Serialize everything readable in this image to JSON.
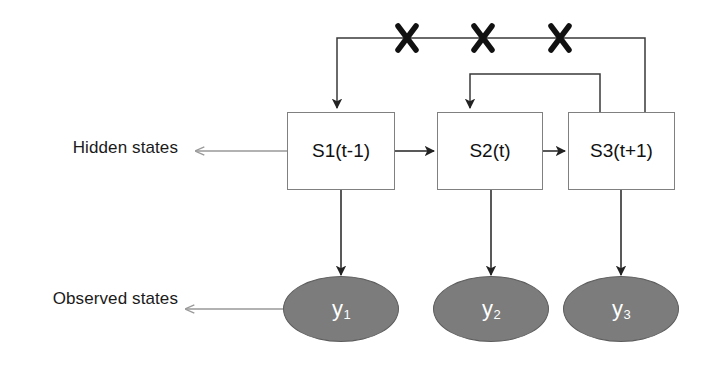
{
  "diagram": {
    "row_labels": {
      "hidden": "Hidden states",
      "observed": "Observed states"
    },
    "colors": {
      "box_stroke": "#808080",
      "box_fill": "#ffffff",
      "ellipse_fill": "#7c7c7c",
      "ellipse_stroke": "#5d5d5d",
      "ellipse_text": "#ffffff",
      "arrow": "#222222",
      "leader_arrow": "#999999",
      "x_mark": "#111111",
      "text": "#1a1a1a"
    },
    "hidden_states": [
      {
        "id": "s1",
        "label": "S1(t-1)"
      },
      {
        "id": "s2",
        "label": "S2(t)"
      },
      {
        "id": "s3",
        "label": "S3(t+1)"
      }
    ],
    "observed_states": [
      {
        "id": "y1",
        "base": "y",
        "sub": "1"
      },
      {
        "id": "y2",
        "base": "y",
        "sub": "2"
      },
      {
        "id": "y3",
        "base": "y",
        "sub": "3"
      }
    ],
    "forward_transitions": [
      {
        "from": "s1",
        "to": "s2"
      },
      {
        "from": "s2",
        "to": "s3"
      }
    ],
    "emissions": [
      {
        "from": "s1",
        "to": "y1"
      },
      {
        "from": "s2",
        "to": "y2"
      },
      {
        "from": "s3",
        "to": "y3"
      }
    ],
    "feedback_transitions": [
      {
        "from": "s3",
        "to": "s1",
        "blocked": true
      },
      {
        "from": "s3",
        "to": "s2",
        "blocked": true
      }
    ],
    "blocked_markers": [
      {
        "id": "x-mark-1",
        "symbol": "X"
      },
      {
        "id": "x-mark-2",
        "symbol": "X"
      },
      {
        "id": "x-mark-3",
        "symbol": "X"
      }
    ]
  }
}
